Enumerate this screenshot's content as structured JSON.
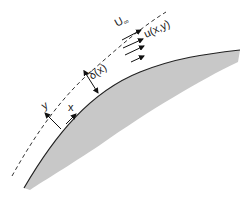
{
  "diagram": {
    "labels": {
      "free_stream": "U",
      "free_stream_sub": "∞",
      "velocity_profile": "u(x,y)",
      "thickness": "δ(x)",
      "x_axis": "x",
      "y_axis": "y"
    },
    "colors": {
      "body_fill": "#c8c8c8",
      "wall_line": "#222222",
      "edge_line": "#333333",
      "arrow": "#111111",
      "background": "#ffffff"
    }
  }
}
